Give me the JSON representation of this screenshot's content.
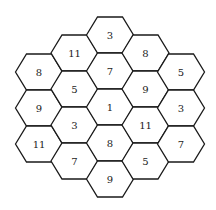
{
  "diagram": {
    "type": "hexagonal-grid",
    "stroke_color": "#1a1a1a",
    "fill_color": "#ffffff",
    "columns": [
      {
        "x": 39,
        "cells": [
          {
            "y": 72,
            "value": "8"
          },
          {
            "y": 108,
            "value": "9"
          },
          {
            "y": 144,
            "value": "11"
          }
        ]
      },
      {
        "x": 74.5,
        "cells": [
          {
            "y": 53,
            "value": "11"
          },
          {
            "y": 89,
            "value": "5"
          },
          {
            "y": 125,
            "value": "3"
          },
          {
            "y": 161,
            "value": "7"
          }
        ]
      },
      {
        "x": 110,
        "cells": [
          {
            "y": 35,
            "value": "3"
          },
          {
            "y": 71,
            "value": "7"
          },
          {
            "y": 107,
            "value": "1"
          },
          {
            "y": 143,
            "value": "8"
          },
          {
            "y": 179,
            "value": "9"
          }
        ]
      },
      {
        "x": 145.5,
        "cells": [
          {
            "y": 53,
            "value": "8"
          },
          {
            "y": 89,
            "value": "9"
          },
          {
            "y": 125,
            "value": "11"
          },
          {
            "y": 161,
            "value": "5"
          }
        ]
      },
      {
        "x": 181,
        "cells": [
          {
            "y": 72,
            "value": "5"
          },
          {
            "y": 108,
            "value": "3"
          },
          {
            "y": 144,
            "value": "7"
          }
        ]
      }
    ]
  }
}
